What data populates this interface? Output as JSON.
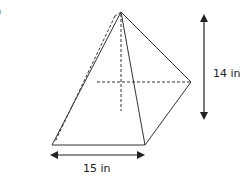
{
  "figure": {
    "marker": ")",
    "shape": "square pyramid",
    "height_label": "14 in",
    "base_label": "15 in",
    "colors": {
      "line": "#333333",
      "background": "#ffffff"
    }
  }
}
